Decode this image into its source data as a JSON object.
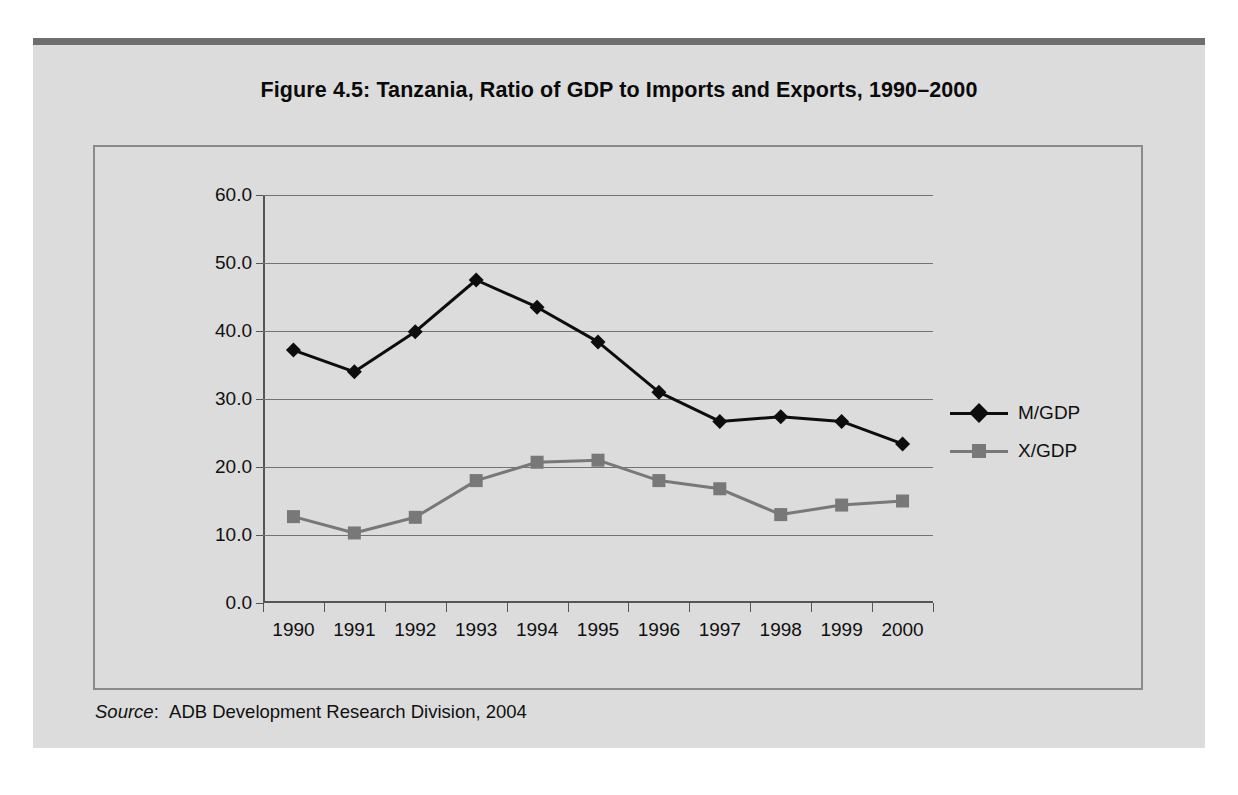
{
  "figure": {
    "title": "Figure 4.5:  Tanzania, Ratio of GDP to Imports and Exports, 1990–2000",
    "source_label": "Source",
    "source_separator": ":",
    "source_text": "ADB Development Research Division, 2004"
  },
  "colors": {
    "page_background": "#ffffff",
    "panel_background": "#dcdcdc",
    "top_rule": "#6e6e6e",
    "frame": "#8a8a8a",
    "axis": "#555555",
    "gridline": "#737373",
    "series_mgdp": "#0d0d0d",
    "series_xgdp": "#787878",
    "text": "#101010"
  },
  "chart_data": {
    "type": "line",
    "title": "Figure 4.5:  Tanzania, Ratio of GDP to Imports and Exports, 1990–2000",
    "xlabel": "",
    "ylabel": "",
    "categories": [
      "1990",
      "1991",
      "1992",
      "1993",
      "1994",
      "1995",
      "1996",
      "1997",
      "1998",
      "1999",
      "2000"
    ],
    "x_tick_labels": [
      "1990",
      "1991",
      "1992",
      "1993",
      "1994",
      "1995",
      "1996",
      "1997",
      "1998",
      "1999",
      "2000"
    ],
    "y_tick_labels": [
      "0.0",
      "10.0",
      "20.0",
      "30.0",
      "40.0",
      "50.0",
      "60.0"
    ],
    "y_ticks": [
      0,
      10,
      20,
      30,
      40,
      50,
      60
    ],
    "ylim": [
      0,
      60
    ],
    "grid": "horizontal",
    "legend_position": "right",
    "series": [
      {
        "name": "M/GDP",
        "marker": "diamond",
        "color": "#0d0d0d",
        "values": [
          37.2,
          34.0,
          39.9,
          47.5,
          43.5,
          38.4,
          31.0,
          26.7,
          27.4,
          26.7,
          23.4
        ]
      },
      {
        "name": "X/GDP",
        "marker": "square",
        "color": "#787878",
        "values": [
          12.7,
          10.3,
          12.6,
          18.0,
          20.7,
          21.0,
          18.0,
          16.8,
          13.0,
          14.4,
          15.0
        ]
      }
    ]
  }
}
